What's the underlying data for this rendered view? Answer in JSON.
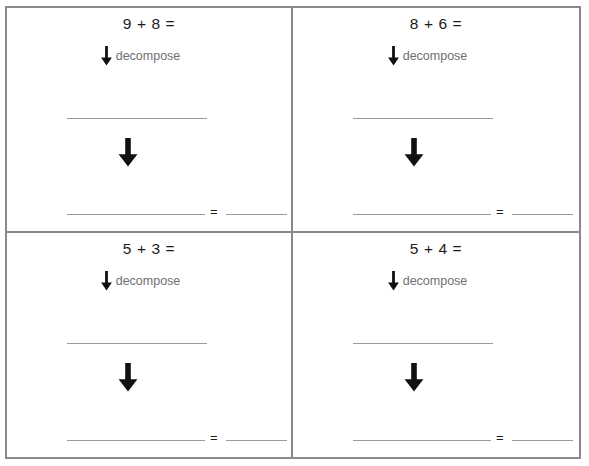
{
  "worksheet": {
    "columns": 2,
    "rows": 2,
    "border_color": "#8a8a8a",
    "line_color": "#9a9a9a",
    "text_color": "#1b1b1b",
    "label_color": "#6f6f6f",
    "cells": [
      {
        "problem": "9 + 8 =",
        "decompose_label": "decompose",
        "equals": "=",
        "blank_1": "",
        "blank_2": "",
        "blank_3": ""
      },
      {
        "problem": "8 + 6 =",
        "decompose_label": "decompose",
        "equals": "=",
        "blank_1": "",
        "blank_2": "",
        "blank_3": ""
      },
      {
        "problem": "5 + 3 =",
        "decompose_label": "decompose",
        "equals": "=",
        "blank_1": "",
        "blank_2": "",
        "blank_3": ""
      },
      {
        "problem": "5 + 4 =",
        "decompose_label": "decompose",
        "equals": "=",
        "blank_1": "",
        "blank_2": "",
        "blank_3": ""
      }
    ]
  }
}
